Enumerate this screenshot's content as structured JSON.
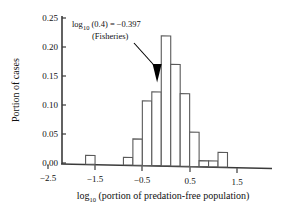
{
  "chart_data": {
    "type": "bar",
    "title": "",
    "subtitle": "",
    "xlabel_parts": {
      "main1": "log",
      "sub": "10",
      "main2": " (portion of predation-free population)"
    },
    "xlabel": "log10 (portion of predation-free population)",
    "ylabel": "Portion of cases",
    "xlim": [
      -2.5,
      1.8
    ],
    "ylim": [
      0.0,
      0.25
    ],
    "grid": false,
    "legend": null,
    "xticks": [
      -2.5,
      -1.5,
      -0.5,
      0.5,
      1.5
    ],
    "xtick_labels": [
      "−2.5",
      "−1.5",
      "−0.5",
      "0.5",
      "1.5"
    ],
    "xminor_ticks": [
      -2.0,
      -1.0,
      0.0,
      1.0
    ],
    "yticks": [
      0.0,
      0.05,
      0.1,
      0.15,
      0.2,
      0.25
    ],
    "ytick_labels": [
      "0.00",
      "0.05",
      "0.10",
      "0.15",
      "0.20",
      "0.25"
    ],
    "bin_width": 0.2,
    "bar_left_edges": [
      -1.7,
      -0.9,
      -0.7,
      -0.5,
      -0.3,
      -0.1,
      0.1,
      0.3,
      0.5,
      0.7,
      0.9,
      1.1
    ],
    "categories": [
      "-1.6",
      "-0.8",
      "-0.6",
      "-0.4",
      "-0.2",
      "0.0",
      "0.2",
      "0.4",
      "0.6",
      "0.8",
      "1.0",
      "1.2"
    ],
    "values": [
      0.015,
      0.013,
      0.045,
      0.111,
      0.127,
      0.224,
      0.175,
      0.125,
      0.059,
      0.01,
      0.01,
      0.025
    ],
    "annotation": {
      "line1": "log",
      "line1_sub": "10",
      "line1_rest": " (0.4) = −0.397",
      "line2": "(Fisheries)",
      "text": "log10 (0.4) = −0.397 (Fisheries)",
      "points_to_x": -0.4,
      "points_to_y": 0.13
    },
    "colors": {
      "bar_edge": "#5a5a5a",
      "bar_fill": "#ffffff",
      "axis": "#3a3a3a",
      "arrow": "#000000"
    }
  }
}
